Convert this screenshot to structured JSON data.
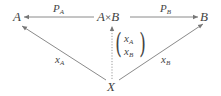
{
  "diagram": {
    "type": "commutative-diagram",
    "nodes": {
      "A": {
        "label": "A"
      },
      "AxB": {
        "left": "A",
        "op": "×",
        "right": "B"
      },
      "B": {
        "label": "B"
      },
      "X": {
        "label": "X"
      }
    },
    "edges": {
      "pA": {
        "base": "P",
        "sub": "A",
        "from": "A×B",
        "to": "A",
        "style": "solid"
      },
      "pB": {
        "base": "P",
        "sub": "B",
        "from": "A×B",
        "to": "B",
        "style": "solid"
      },
      "xA": {
        "base": "x",
        "sub": "A",
        "from": "X",
        "to": "A",
        "style": "solid"
      },
      "xB": {
        "base": "x",
        "sub": "B",
        "from": "X",
        "to": "B",
        "style": "solid"
      },
      "pair": {
        "from": "X",
        "to": "A×B",
        "style": "dotted",
        "row1": {
          "base": "x",
          "sub": "A"
        },
        "row2": {
          "base": "x",
          "sub": "B"
        }
      }
    },
    "colors": {
      "line": "#8a8a8a",
      "text": "#444444"
    }
  }
}
